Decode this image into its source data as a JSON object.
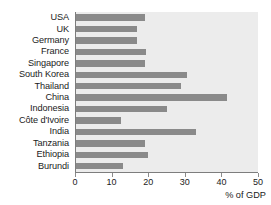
{
  "chart_data": {
    "type": "bar",
    "orientation": "horizontal",
    "title": "",
    "subtitle": "",
    "xlabel": "% of GDP",
    "ylabel": "",
    "xlim": [
      0,
      50
    ],
    "xticks": [
      0,
      10,
      20,
      30,
      40,
      50
    ],
    "xtick_labels": [
      "0",
      "10",
      "20",
      "30",
      "40",
      "50"
    ],
    "grid": false,
    "legend": null,
    "categories": [
      "USA",
      "UK",
      "Germany",
      "France",
      "Singapore",
      "South Korea",
      "Thailand",
      "China",
      "Indonesia",
      "Côte d'Ivoire",
      "India",
      "Tanzania",
      "Ethiopia",
      "Burundi"
    ],
    "values": [
      19,
      17,
      17,
      19.5,
      19,
      30.5,
      29,
      41.5,
      25,
      12.5,
      33,
      19,
      20,
      13
    ],
    "bar_color": "#8a8a8a",
    "plot_background": "#ececec",
    "axis_color": "#7d7d7d"
  }
}
